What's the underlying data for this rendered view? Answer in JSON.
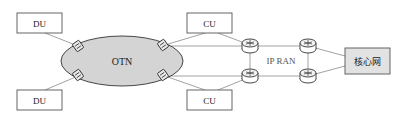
{
  "diagram": {
    "nodes": {
      "du_top": {
        "label": "DU"
      },
      "du_bottom": {
        "label": "DU"
      },
      "otn": {
        "label": "OTN"
      },
      "cu_top": {
        "label": "CU"
      },
      "cu_bottom": {
        "label": "CU"
      },
      "ipran": {
        "label": "IP RAN"
      },
      "core": {
        "label": "核心网"
      }
    },
    "colors": {
      "line": "#8a8a8a",
      "box_border": "#555555",
      "otn_fill": "#d4d4d4",
      "core_fill": "#e2e2e2"
    },
    "edges": [
      [
        "du_top",
        "otn_switch_tl"
      ],
      [
        "du_bottom",
        "otn_switch_bl"
      ],
      [
        "otn_switch_tr",
        "cu_top"
      ],
      [
        "otn_switch_br",
        "cu_bottom"
      ],
      [
        "otn_switch_tr",
        "router_tl"
      ],
      [
        "otn_switch_br",
        "router_bl"
      ],
      [
        "cu_top",
        "router_tl"
      ],
      [
        "cu_bottom",
        "router_bl"
      ],
      [
        "router_tl",
        "router_tr"
      ],
      [
        "router_bl",
        "router_br"
      ],
      [
        "router_tl",
        "router_bl"
      ],
      [
        "router_tr",
        "router_br"
      ],
      [
        "router_tr",
        "core"
      ],
      [
        "router_br",
        "core"
      ]
    ]
  }
}
